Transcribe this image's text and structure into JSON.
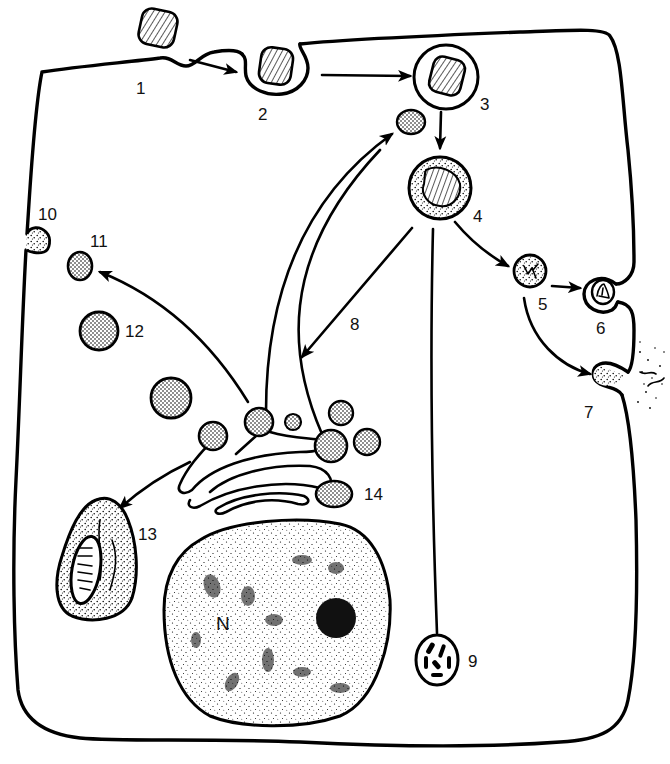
{
  "diagram": {
    "colors": {
      "ink": "#000000",
      "background": "#ffffff"
    },
    "labels": {
      "l1": "1",
      "l2": "2",
      "l3": "3",
      "l4": "4",
      "l5": "5",
      "l6": "6",
      "l7": "7",
      "l8": "8",
      "l9": "9",
      "l10": "10",
      "l11": "11",
      "l12": "12",
      "l13": "13",
      "l14": "14",
      "nucleus": "N"
    },
    "structures": [
      {
        "id": "1",
        "depicts": "particle contacting plasma membrane (invagination)"
      },
      {
        "id": "2",
        "depicts": "particle enclosed by invaginating membrane"
      },
      {
        "id": "3",
        "depicts": "phagosome containing hatched particle"
      },
      {
        "id": "4",
        "depicts": "phagolysosome (stippled, with digesting particle)"
      },
      {
        "id": "5",
        "depicts": "residual body"
      },
      {
        "id": "6",
        "depicts": "residual body fusing with membrane"
      },
      {
        "id": "7",
        "depicts": "exocytosis of contents to exterior"
      },
      {
        "id": "8",
        "depicts": "arrow from 4 back toward Golgi region"
      },
      {
        "id": "9",
        "depicts": "lipofuscin / residual body with dark inclusions"
      },
      {
        "id": "10",
        "depicts": "vesicle fusing with plasma membrane (secretion)"
      },
      {
        "id": "11",
        "depicts": "small stippled vesicle"
      },
      {
        "id": "12",
        "depicts": "larger stippled vesicle (primary lysosome)"
      },
      {
        "id": "13",
        "depicts": "autophagic vacuole containing mitochondrion"
      },
      {
        "id": "14",
        "depicts": "Golgi apparatus with budding vesicles"
      },
      {
        "id": "N",
        "depicts": "nucleus with nucleolus"
      }
    ]
  }
}
